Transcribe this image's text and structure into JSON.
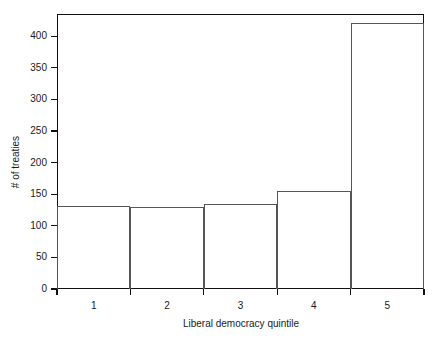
{
  "chart_data": {
    "type": "bar",
    "title": "",
    "subtitle": "",
    "xlabel": "Liberal democracy quintile",
    "ylabel": "# of treaties",
    "categories": [
      "1",
      "2",
      "3",
      "4",
      "5"
    ],
    "values": [
      131,
      130,
      135,
      155,
      420
    ],
    "series": [
      {
        "name": "# of treaties",
        "values": [
          131,
          130,
          135,
          155,
          420
        ]
      }
    ],
    "xlim": [
      0.5,
      5.5
    ],
    "ylim": [
      0,
      435
    ],
    "yticks": [
      0,
      50,
      100,
      150,
      200,
      250,
      300,
      350,
      400
    ],
    "ytick_labels": [
      "0",
      "50",
      "100",
      "150",
      "200",
      "250",
      "300",
      "350",
      "400"
    ],
    "xticks": [
      1,
      2,
      3,
      4,
      5
    ],
    "xtick_labels": [
      "1",
      "2",
      "3",
      "4",
      "5"
    ],
    "grid": false,
    "legend": null,
    "legend_position": "none",
    "annotations": [],
    "style": {
      "bar_fill": "transparent",
      "bar_edge_color": "#555555",
      "frame_color": "#111111",
      "background": "#ffffff",
      "text_color": "#1a1a1a"
    }
  }
}
